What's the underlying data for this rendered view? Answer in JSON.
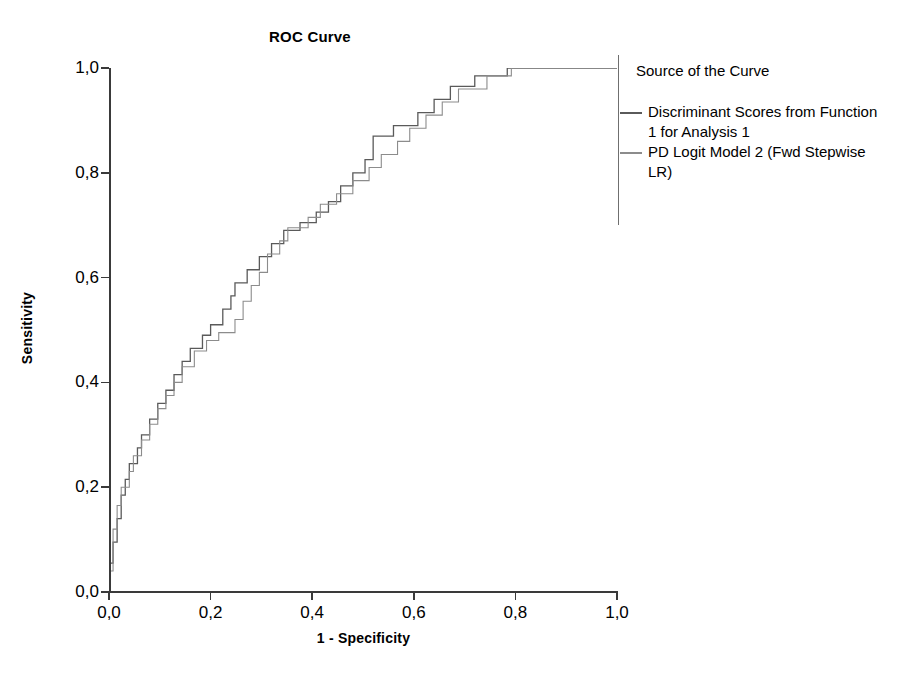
{
  "chart_data": {
    "type": "line",
    "title": "ROC Curve",
    "xlabel": "1 - Specificity",
    "ylabel": "Sensitivity",
    "xlim": [
      0.0,
      1.0
    ],
    "ylim": [
      0.0,
      1.0
    ],
    "grid": false,
    "decimal_separator": ",",
    "xticks": [
      "0,0",
      "0,2",
      "0,4",
      "0,6",
      "0,8",
      "1,0"
    ],
    "xtick_values": [
      0.0,
      0.2,
      0.4,
      0.6,
      0.8,
      1.0
    ],
    "yticks": [
      "0,0",
      "0,2",
      "0,4",
      "0,6",
      "0,8",
      "1,0"
    ],
    "ytick_values": [
      0.0,
      0.2,
      0.4,
      0.6,
      0.8,
      1.0
    ],
    "legend_position": "right",
    "legend_title": "Source of the Curve",
    "series": [
      {
        "name": "Discriminant Scores from Function 1 for Analysis 1",
        "color": "#5a5a5a",
        "step": "post",
        "points": [
          [
            0.0,
            0.0
          ],
          [
            0.0,
            0.055
          ],
          [
            0.008,
            0.055
          ],
          [
            0.008,
            0.095
          ],
          [
            0.016,
            0.095
          ],
          [
            0.016,
            0.14
          ],
          [
            0.024,
            0.14
          ],
          [
            0.024,
            0.185
          ],
          [
            0.032,
            0.185
          ],
          [
            0.032,
            0.215
          ],
          [
            0.04,
            0.215
          ],
          [
            0.04,
            0.245
          ],
          [
            0.056,
            0.245
          ],
          [
            0.056,
            0.275
          ],
          [
            0.064,
            0.275
          ],
          [
            0.064,
            0.3
          ],
          [
            0.08,
            0.3
          ],
          [
            0.08,
            0.33
          ],
          [
            0.096,
            0.33
          ],
          [
            0.096,
            0.36
          ],
          [
            0.112,
            0.36
          ],
          [
            0.112,
            0.385
          ],
          [
            0.128,
            0.385
          ],
          [
            0.128,
            0.415
          ],
          [
            0.144,
            0.415
          ],
          [
            0.144,
            0.44
          ],
          [
            0.16,
            0.44
          ],
          [
            0.16,
            0.465
          ],
          [
            0.184,
            0.465
          ],
          [
            0.184,
            0.49
          ],
          [
            0.2,
            0.49
          ],
          [
            0.2,
            0.51
          ],
          [
            0.224,
            0.51
          ],
          [
            0.224,
            0.54
          ],
          [
            0.24,
            0.54
          ],
          [
            0.24,
            0.565
          ],
          [
            0.248,
            0.565
          ],
          [
            0.248,
            0.59
          ],
          [
            0.272,
            0.59
          ],
          [
            0.272,
            0.615
          ],
          [
            0.296,
            0.615
          ],
          [
            0.296,
            0.64
          ],
          [
            0.32,
            0.64
          ],
          [
            0.32,
            0.665
          ],
          [
            0.344,
            0.665
          ],
          [
            0.344,
            0.69
          ],
          [
            0.376,
            0.69
          ],
          [
            0.376,
            0.705
          ],
          [
            0.408,
            0.705
          ],
          [
            0.408,
            0.725
          ],
          [
            0.432,
            0.725
          ],
          [
            0.432,
            0.745
          ],
          [
            0.456,
            0.745
          ],
          [
            0.456,
            0.775
          ],
          [
            0.48,
            0.775
          ],
          [
            0.48,
            0.8
          ],
          [
            0.504,
            0.8
          ],
          [
            0.504,
            0.825
          ],
          [
            0.52,
            0.825
          ],
          [
            0.52,
            0.87
          ],
          [
            0.56,
            0.87
          ],
          [
            0.56,
            0.89
          ],
          [
            0.608,
            0.89
          ],
          [
            0.608,
            0.915
          ],
          [
            0.64,
            0.915
          ],
          [
            0.64,
            0.94
          ],
          [
            0.672,
            0.94
          ],
          [
            0.672,
            0.965
          ],
          [
            0.72,
            0.965
          ],
          [
            0.72,
            0.985
          ],
          [
            0.784,
            0.985
          ],
          [
            0.784,
            1.0
          ],
          [
            1.0,
            1.0
          ]
        ]
      },
      {
        "name": "PD Logit Model 2 (Fwd Stepwise LR)",
        "color": "#8c8c8c",
        "step": "post",
        "points": [
          [
            0.0,
            0.0
          ],
          [
            0.0,
            0.04
          ],
          [
            0.008,
            0.04
          ],
          [
            0.008,
            0.08
          ],
          [
            0.008,
            0.12
          ],
          [
            0.016,
            0.12
          ],
          [
            0.016,
            0.165
          ],
          [
            0.024,
            0.165
          ],
          [
            0.024,
            0.2
          ],
          [
            0.04,
            0.2
          ],
          [
            0.04,
            0.23
          ],
          [
            0.048,
            0.23
          ],
          [
            0.048,
            0.26
          ],
          [
            0.064,
            0.26
          ],
          [
            0.064,
            0.29
          ],
          [
            0.08,
            0.29
          ],
          [
            0.08,
            0.32
          ],
          [
            0.096,
            0.32
          ],
          [
            0.096,
            0.35
          ],
          [
            0.112,
            0.35
          ],
          [
            0.112,
            0.375
          ],
          [
            0.128,
            0.375
          ],
          [
            0.128,
            0.4
          ],
          [
            0.144,
            0.4
          ],
          [
            0.144,
            0.43
          ],
          [
            0.168,
            0.43
          ],
          [
            0.168,
            0.46
          ],
          [
            0.192,
            0.46
          ],
          [
            0.192,
            0.48
          ],
          [
            0.216,
            0.48
          ],
          [
            0.216,
            0.495
          ],
          [
            0.248,
            0.495
          ],
          [
            0.248,
            0.52
          ],
          [
            0.264,
            0.52
          ],
          [
            0.264,
            0.555
          ],
          [
            0.28,
            0.555
          ],
          [
            0.28,
            0.585
          ],
          [
            0.296,
            0.585
          ],
          [
            0.296,
            0.61
          ],
          [
            0.312,
            0.61
          ],
          [
            0.312,
            0.645
          ],
          [
            0.336,
            0.645
          ],
          [
            0.336,
            0.67
          ],
          [
            0.352,
            0.67
          ],
          [
            0.352,
            0.695
          ],
          [
            0.392,
            0.695
          ],
          [
            0.392,
            0.715
          ],
          [
            0.416,
            0.715
          ],
          [
            0.416,
            0.74
          ],
          [
            0.448,
            0.74
          ],
          [
            0.448,
            0.76
          ],
          [
            0.48,
            0.76
          ],
          [
            0.48,
            0.785
          ],
          [
            0.512,
            0.785
          ],
          [
            0.512,
            0.81
          ],
          [
            0.536,
            0.81
          ],
          [
            0.536,
            0.835
          ],
          [
            0.568,
            0.835
          ],
          [
            0.568,
            0.86
          ],
          [
            0.592,
            0.86
          ],
          [
            0.592,
            0.885
          ],
          [
            0.624,
            0.885
          ],
          [
            0.624,
            0.91
          ],
          [
            0.656,
            0.91
          ],
          [
            0.656,
            0.935
          ],
          [
            0.688,
            0.935
          ],
          [
            0.688,
            0.96
          ],
          [
            0.744,
            0.96
          ],
          [
            0.744,
            0.985
          ],
          [
            0.792,
            0.985
          ],
          [
            0.792,
            1.0
          ],
          [
            1.0,
            1.0
          ]
        ]
      }
    ]
  },
  "axes": {
    "x_title": "1 - Specificity",
    "y_title": "Sensitivity",
    "x_ticks": [
      "0,0",
      "0,2",
      "0,4",
      "0,6",
      "0,8",
      "1,0"
    ],
    "y_ticks": [
      "0,0",
      "0,2",
      "0,4",
      "0,6",
      "0,8",
      "1,0"
    ]
  },
  "legend": {
    "title": "Source of the Curve",
    "entries": [
      {
        "label": "Discriminant Scores from Function 1 for Analysis 1",
        "color": "#5a5a5a"
      },
      {
        "label": "PD Logit Model 2 (Fwd Stepwise LR)",
        "color": "#8c8c8c"
      }
    ]
  },
  "colors": {
    "axis": "#3a3a3a",
    "series_1": "#5a5a5a",
    "series_2": "#8c8c8c",
    "background": "#ffffff"
  }
}
